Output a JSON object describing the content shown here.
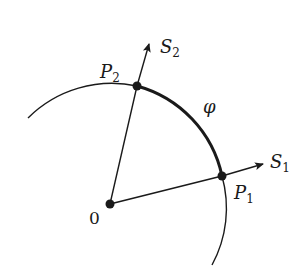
{
  "diagram": {
    "colors": {
      "ink": "#1a1a1a",
      "background": "#ffffff"
    },
    "origin": {
      "label": "0"
    },
    "points": [
      {
        "id": "P1",
        "letter": "P",
        "sub": "1"
      },
      {
        "id": "P2",
        "letter": "P",
        "sub": "2"
      }
    ],
    "vectors": [
      {
        "id": "S1",
        "letter": "S",
        "sub": "1"
      },
      {
        "id": "S2",
        "letter": "S",
        "sub": "2"
      }
    ],
    "arc_label": "φ"
  }
}
